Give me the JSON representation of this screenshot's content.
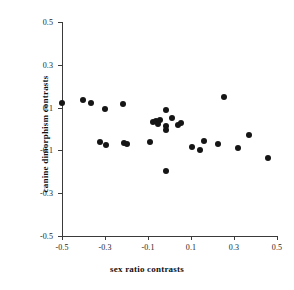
{
  "chart_data": {
    "type": "scatter",
    "title": "",
    "xlabel": "sex ratio contrasts",
    "ylabel": "canine dimorphism contrasts",
    "xlim": [
      -0.5,
      0.5
    ],
    "ylim": [
      -0.5,
      0.5
    ],
    "xticks": [
      -0.5,
      -0.3,
      -0.1,
      0.1,
      0.3,
      0.5
    ],
    "yticks": [
      -0.5,
      -0.3,
      -0.1,
      0.1,
      0.3,
      0.5
    ],
    "xtick_labels": [
      "-0.5",
      "-0.3",
      "-0.1",
      "0.1",
      "0.3",
      "0.5"
    ],
    "ytick_labels": [
      "-0.5",
      "-0.3",
      "-0.1",
      "0.1",
      "0.3",
      "0.5"
    ],
    "grid": false,
    "legend": null,
    "marker": "filled-circle",
    "marker_color": "#151515",
    "axis_color": "#3a3a3a",
    "background_color": "#ffffff",
    "n_points": 33,
    "points": [
      {
        "x": -0.5,
        "y": 0.122
      },
      {
        "x": -0.402,
        "y": 0.136
      },
      {
        "x": -0.365,
        "y": 0.122
      },
      {
        "x": -0.3,
        "y": 0.094
      },
      {
        "x": -0.216,
        "y": 0.117
      },
      {
        "x": -0.323,
        "y": -0.061
      },
      {
        "x": -0.295,
        "y": -0.075
      },
      {
        "x": -0.211,
        "y": -0.066
      },
      {
        "x": -0.197,
        "y": -0.07
      },
      {
        "x": -0.076,
        "y": 0.033
      },
      {
        "x": -0.062,
        "y": 0.038
      },
      {
        "x": -0.053,
        "y": 0.024
      },
      {
        "x": -0.044,
        "y": 0.043
      },
      {
        "x": -0.016,
        "y": 0.089
      },
      {
        "x": -0.016,
        "y": 0.014
      },
      {
        "x": -0.016,
        "y": -0.005
      },
      {
        "x": 0.011,
        "y": 0.052
      },
      {
        "x": 0.039,
        "y": 0.019
      },
      {
        "x": 0.053,
        "y": 0.029
      },
      {
        "x": -0.09,
        "y": -0.061
      },
      {
        "x": -0.016,
        "y": -0.196
      },
      {
        "x": 0.104,
        "y": -0.084
      },
      {
        "x": 0.141,
        "y": -0.098
      },
      {
        "x": 0.16,
        "y": -0.056
      },
      {
        "x": 0.225,
        "y": -0.07
      },
      {
        "x": 0.253,
        "y": 0.15
      },
      {
        "x": 0.318,
        "y": -0.089
      },
      {
        "x": 0.369,
        "y": -0.028
      },
      {
        "x": 0.457,
        "y": -0.136
      }
    ]
  },
  "axes": {
    "x_title": "sex ratio contrasts",
    "y_title": "canine dimorphism contrasts"
  }
}
